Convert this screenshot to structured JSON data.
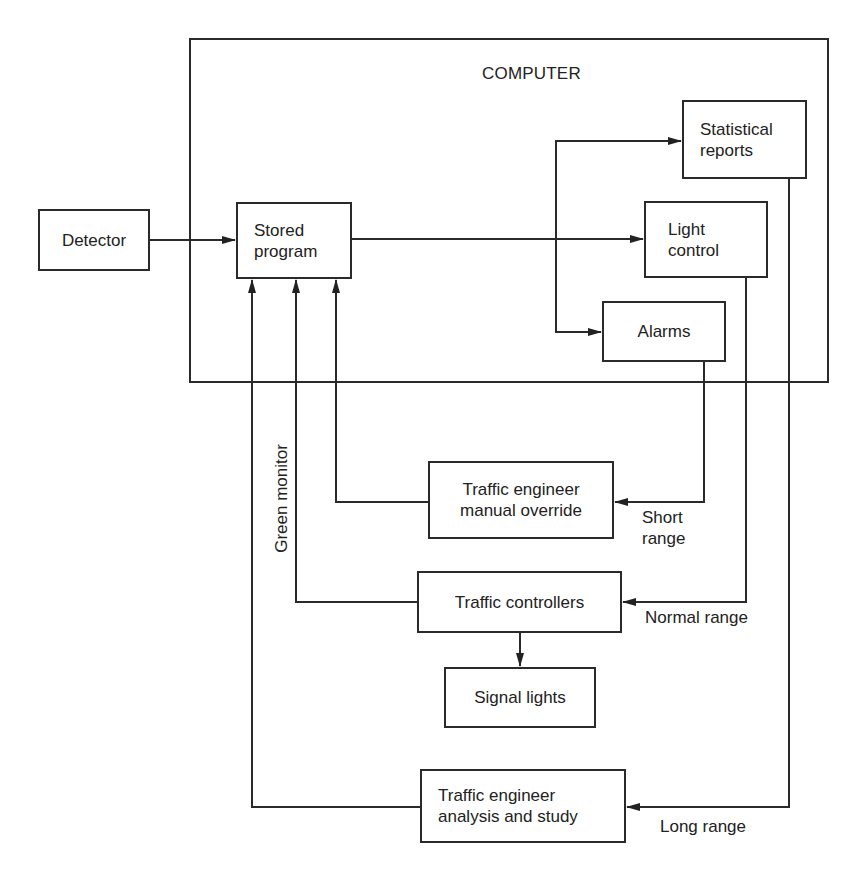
{
  "diagram": {
    "container": {
      "title": "COMPUTER"
    },
    "nodes": {
      "detector": {
        "label": "Detector"
      },
      "stored_program": {
        "label": "Stored\nprogram"
      },
      "statistical_reports": {
        "label": "Statistical\nreports"
      },
      "light_control": {
        "label": "Light\ncontrol"
      },
      "alarms": {
        "label": "Alarms"
      },
      "manual_override": {
        "label": "Traffic engineer\nmanual override"
      },
      "traffic_controllers": {
        "label": "Traffic controllers"
      },
      "signal_lights": {
        "label": "Signal lights"
      },
      "analysis_study": {
        "label": "Traffic engineer\nanalysis and study"
      }
    },
    "edge_labels": {
      "short_range": "Short\nrange",
      "normal_range": "Normal range",
      "long_range": "Long range",
      "green_monitor": "Green monitor"
    },
    "edges": [
      {
        "from": "Detector",
        "to": "Stored program"
      },
      {
        "from": "Stored program",
        "to": "Light control"
      },
      {
        "from": "Stored program",
        "to": "Statistical reports"
      },
      {
        "from": "Stored program",
        "to": "Alarms"
      },
      {
        "from": "Alarms",
        "to": "Traffic engineer manual override",
        "label": "Short range"
      },
      {
        "from": "Light control",
        "to": "Traffic controllers",
        "label": "Normal range"
      },
      {
        "from": "Statistical reports",
        "to": "Traffic engineer analysis and study",
        "label": "Long range"
      },
      {
        "from": "Traffic controllers",
        "to": "Signal lights"
      },
      {
        "from": "Traffic engineer manual override",
        "to": "Stored program"
      },
      {
        "from": "Traffic controllers",
        "to": "Stored program",
        "label": "Green monitor"
      },
      {
        "from": "Traffic engineer analysis and study",
        "to": "Stored program"
      }
    ]
  }
}
